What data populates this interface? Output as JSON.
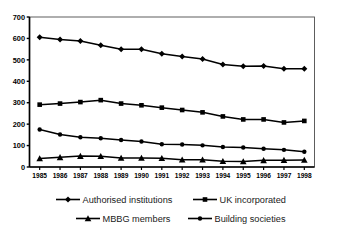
{
  "chart_data": {
    "type": "line",
    "title": "",
    "subtitle": "",
    "xlabel": "",
    "ylabel": "",
    "categories": [
      "1985",
      "1986",
      "1987",
      "1988",
      "1989",
      "1990",
      "1991",
      "1992",
      "1993",
      "1994",
      "1995",
      "1996",
      "1997",
      "1998"
    ],
    "x": [
      1985,
      1986,
      1987,
      1988,
      1989,
      1990,
      1991,
      1992,
      1993,
      1994,
      1995,
      1996,
      1997,
      1998
    ],
    "ylim": [
      0,
      700
    ],
    "yticks": [
      0,
      100,
      200,
      300,
      400,
      500,
      600,
      700
    ],
    "ytick_labels": [
      "0",
      "100",
      "200",
      "300",
      "400",
      "500",
      "600",
      "700"
    ],
    "grid": false,
    "legend_position": "bottom",
    "series": [
      {
        "name": "Authorised institutions",
        "marker": "diamond",
        "color": "#000000",
        "values": [
          605,
          595,
          588,
          568,
          550,
          550,
          529,
          516,
          504,
          478,
          470,
          471,
          459,
          458
        ]
      },
      {
        "name": "UK incorporated",
        "marker": "square",
        "color": "#000000",
        "values": [
          291,
          296,
          303,
          312,
          296,
          288,
          277,
          266,
          255,
          236,
          222,
          222,
          208,
          215
        ]
      },
      {
        "name": "MBBG members",
        "marker": "triangle",
        "color": "#000000",
        "values": [
          40,
          45,
          51,
          50,
          42,
          42,
          41,
          34,
          34,
          27,
          26,
          31,
          32,
          33
        ]
      },
      {
        "name": "Building societies",
        "marker": "circle",
        "color": "#000000",
        "values": [
          175,
          152,
          139,
          134,
          126,
          119,
          106,
          105,
          101,
          93,
          91,
          85,
          80,
          71
        ]
      }
    ]
  },
  "axes": {
    "x_label_count": 14,
    "y_max_label": "700",
    "y_min_label": "0"
  },
  "legend": {
    "items": [
      {
        "label": "Authorised institutions",
        "marker": "diamond"
      },
      {
        "label": "UK incorporated",
        "marker": "square"
      },
      {
        "label": "MBBG members",
        "marker": "triangle"
      },
      {
        "label": "Building societies",
        "marker": "circle"
      }
    ]
  }
}
